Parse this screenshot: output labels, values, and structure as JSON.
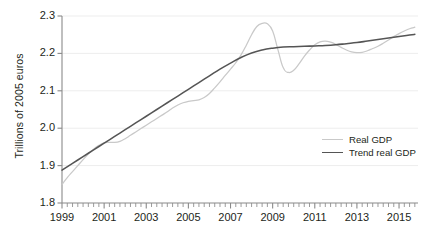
{
  "chart_data": {
    "type": "line",
    "title": "",
    "xlabel": "",
    "ylabel": "Trillions of 2005 euros",
    "xlim": [
      1999,
      2015.9
    ],
    "ylim": [
      1.8,
      2.3
    ],
    "grid": "horizontal",
    "legend_position": "inside-right",
    "y_ticks": [
      "1.8",
      "1.9",
      "2.0",
      "2.1",
      "2.2",
      "2.3"
    ],
    "y_tick_values": [
      1.8,
      1.9,
      2.0,
      2.1,
      2.2,
      2.3
    ],
    "x_ticks": [
      "1999",
      "2001",
      "2003",
      "2005",
      "2007",
      "2009",
      "2011",
      "2013",
      "2015"
    ],
    "x_tick_values": [
      1999,
      2001,
      2003,
      2005,
      2007,
      2009,
      2011,
      2013,
      2015
    ],
    "x_minor_tick_step": 0.25,
    "series": [
      {
        "name": "Real GDP",
        "color": "#c9c9c9",
        "x": [
          1999.0,
          1999.25,
          1999.5,
          1999.75,
          2000.0,
          2000.25,
          2000.5,
          2000.75,
          2001.0,
          2001.25,
          2001.5,
          2001.75,
          2002.0,
          2002.25,
          2002.5,
          2002.75,
          2003.0,
          2003.25,
          2003.5,
          2003.75,
          2004.0,
          2004.25,
          2004.5,
          2004.75,
          2005.0,
          2005.25,
          2005.5,
          2005.75,
          2006.0,
          2006.25,
          2006.5,
          2006.75,
          2007.0,
          2007.25,
          2007.5,
          2007.75,
          2008.0,
          2008.25,
          2008.5,
          2008.75,
          2009.0,
          2009.25,
          2009.5,
          2009.75,
          2010.0,
          2010.25,
          2010.5,
          2010.75,
          2011.0,
          2011.25,
          2011.5,
          2011.75,
          2012.0,
          2012.25,
          2012.5,
          2012.75,
          2013.0,
          2013.25,
          2013.5,
          2013.75,
          2014.0,
          2014.25,
          2014.5,
          2014.75,
          2015.0,
          2015.25,
          2015.5,
          2015.75
        ],
        "y": [
          1.85,
          1.868,
          1.884,
          1.9,
          1.916,
          1.931,
          1.944,
          1.954,
          1.961,
          1.962,
          1.962,
          1.965,
          1.972,
          1.981,
          1.99,
          1.999,
          2.008,
          2.017,
          2.026,
          2.035,
          2.044,
          2.054,
          2.062,
          2.068,
          2.072,
          2.074,
          2.076,
          2.082,
          2.093,
          2.108,
          2.124,
          2.141,
          2.158,
          2.175,
          2.196,
          2.222,
          2.25,
          2.272,
          2.28,
          2.279,
          2.26,
          2.21,
          2.162,
          2.149,
          2.155,
          2.172,
          2.192,
          2.209,
          2.223,
          2.231,
          2.233,
          2.23,
          2.224,
          2.216,
          2.209,
          2.204,
          2.202,
          2.203,
          2.207,
          2.213,
          2.219,
          2.227,
          2.236,
          2.245,
          2.253,
          2.26,
          2.266,
          2.27
        ]
      },
      {
        "name": "Trend real GDP",
        "color": "#555555",
        "x": [
          1999.0,
          1999.5,
          2000.0,
          2000.5,
          2001.0,
          2001.5,
          2002.0,
          2002.5,
          2003.0,
          2003.5,
          2004.0,
          2004.5,
          2005.0,
          2005.5,
          2006.0,
          2006.5,
          2007.0,
          2007.5,
          2008.0,
          2008.5,
          2009.0,
          2009.5,
          2010.0,
          2010.5,
          2011.0,
          2011.5,
          2012.0,
          2012.5,
          2013.0,
          2013.5,
          2014.0,
          2014.5,
          2015.0,
          2015.5,
          2015.75
        ],
        "y": [
          1.888,
          1.906,
          1.924,
          1.942,
          1.96,
          1.978,
          1.996,
          2.014,
          2.032,
          2.05,
          2.068,
          2.086,
          2.104,
          2.122,
          2.14,
          2.158,
          2.174,
          2.189,
          2.201,
          2.209,
          2.214,
          2.217,
          2.218,
          2.219,
          2.22,
          2.221,
          2.223,
          2.226,
          2.229,
          2.233,
          2.237,
          2.241,
          2.245,
          2.249,
          2.251
        ]
      }
    ]
  },
  "legend": {
    "items": [
      {
        "label": "Real GDP",
        "color": "#c9c9c9"
      },
      {
        "label": "Trend real GDP",
        "color": "#555555"
      }
    ]
  },
  "axes": {
    "y_title": "Trillions of 2005 euros"
  }
}
